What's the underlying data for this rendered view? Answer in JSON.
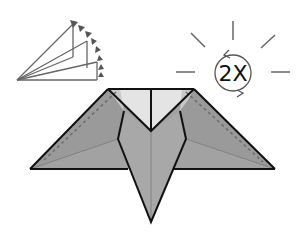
{
  "diagram": {
    "repeat_badge": {
      "text": "2X",
      "meaning": "repeat twice / turn over and repeat",
      "icon": "rotate-arrows-icon"
    },
    "fold_indicator": {
      "icon": "fold-fan-arrow-icon",
      "meaning": "fold in progressive steps along arc"
    },
    "colors": {
      "paper_dark": "#9a9a9a",
      "paper_mid": "#a8a8a8",
      "paper_light": "#e4e4e4",
      "outline": "#111111",
      "guide_line": "#7a7a7a",
      "dashed_fold": "#6e6e6e",
      "icon_stroke": "#666666"
    }
  }
}
